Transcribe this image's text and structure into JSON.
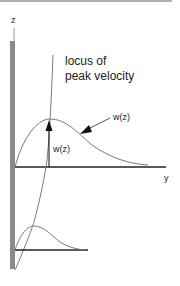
{
  "figure": {
    "labels": {
      "z_axis": "z",
      "y_axis": "y",
      "locus_line1": "locus of",
      "locus_line2": "peak velocity",
      "w_outer": "w(z)",
      "w_inner": "w(z)"
    },
    "colors": {
      "wall": "#8a8a8a",
      "axis": "#222222",
      "curve": "#7a7a7a",
      "arrow": "#111111",
      "top_rule": "#b0b0b0"
    }
  }
}
